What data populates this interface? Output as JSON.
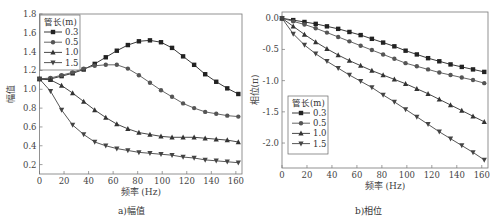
{
  "figure": {
    "captions": [
      "a)幅值",
      "b)相位"
    ]
  },
  "chart_data": [
    {
      "type": "line",
      "title": "a)幅值",
      "xlabel": "频率 (Hz)",
      "ylabel": "幅值",
      "xlim": [
        0,
        165
      ],
      "ylim": [
        0.1,
        1.8
      ],
      "xticks": [
        0,
        20,
        40,
        60,
        80,
        100,
        120,
        140,
        160
      ],
      "yticks": [
        0.2,
        0.4,
        0.6,
        0.8,
        1.0,
        1.2,
        1.4,
        1.6,
        1.8
      ],
      "ytick_labels": [
        "0.2",
        "0.4",
        "0.6",
        "0.8",
        "1.0",
        "1.2",
        "1.4",
        "1.6",
        "1.8"
      ],
      "grid": false,
      "legend": {
        "title": "管长(m)",
        "position": "upper left"
      },
      "x": [
        0,
        9,
        18,
        27,
        36,
        45,
        54,
        63,
        72,
        81,
        90,
        99,
        108,
        117,
        126,
        135,
        144,
        153,
        162
      ],
      "series": [
        {
          "name": "0.3",
          "marker": "square",
          "values": [
            1.11,
            1.11,
            1.14,
            1.17,
            1.21,
            1.27,
            1.34,
            1.41,
            1.47,
            1.51,
            1.52,
            1.5,
            1.44,
            1.35,
            1.26,
            1.16,
            1.08,
            1.01,
            0.95
          ]
        },
        {
          "name": "0.5",
          "marker": "circle",
          "values": [
            1.11,
            1.12,
            1.15,
            1.18,
            1.22,
            1.25,
            1.26,
            1.26,
            1.22,
            1.15,
            1.07,
            0.99,
            0.92,
            0.85,
            0.8,
            0.76,
            0.74,
            0.72,
            0.71
          ]
        },
        {
          "name": "1.0",
          "marker": "triangle-up",
          "values": [
            1.11,
            1.1,
            1.04,
            0.96,
            0.87,
            0.78,
            0.7,
            0.63,
            0.58,
            0.54,
            0.52,
            0.5,
            0.49,
            0.49,
            0.49,
            0.48,
            0.47,
            0.46,
            0.44
          ]
        },
        {
          "name": "1.5",
          "marker": "triangle-down",
          "values": [
            1.11,
            0.98,
            0.78,
            0.62,
            0.52,
            0.44,
            0.4,
            0.37,
            0.35,
            0.33,
            0.32,
            0.31,
            0.3,
            0.28,
            0.27,
            0.25,
            0.24,
            0.23,
            0.22
          ]
        }
      ]
    },
    {
      "type": "line",
      "title": "b)相位",
      "xlabel": "频率 (Hz)",
      "ylabel": "相位(π)",
      "xlim": [
        0,
        165
      ],
      "ylim": [
        -2.4,
        0.1
      ],
      "xticks": [
        0,
        20,
        40,
        60,
        80,
        100,
        120,
        140,
        160
      ],
      "yticks": [
        0.0,
        -0.5,
        -1.0,
        -1.5,
        -2.0
      ],
      "ytick_labels": [
        "0.0",
        "-0.5",
        "-1.0",
        "-1.5",
        "-2.0"
      ],
      "grid": false,
      "legend": {
        "title": "管长(m)",
        "position": "lower left"
      },
      "x": [
        0,
        9,
        18,
        27,
        36,
        45,
        54,
        63,
        72,
        81,
        90,
        99,
        108,
        117,
        126,
        135,
        144,
        153,
        162
      ],
      "series": [
        {
          "name": "0.3",
          "marker": "square",
          "values": [
            0.0,
            -0.03,
            -0.06,
            -0.09,
            -0.13,
            -0.17,
            -0.22,
            -0.27,
            -0.33,
            -0.39,
            -0.45,
            -0.52,
            -0.58,
            -0.64,
            -0.69,
            -0.74,
            -0.78,
            -0.82,
            -0.86
          ]
        },
        {
          "name": "0.5",
          "marker": "circle",
          "values": [
            0.0,
            -0.05,
            -0.1,
            -0.16,
            -0.23,
            -0.3,
            -0.37,
            -0.44,
            -0.51,
            -0.58,
            -0.65,
            -0.72,
            -0.77,
            -0.82,
            -0.87,
            -0.91,
            -0.95,
            -0.99,
            -1.04
          ]
        },
        {
          "name": "1.0",
          "marker": "triangle-up",
          "values": [
            0.0,
            -0.13,
            -0.26,
            -0.38,
            -0.49,
            -0.59,
            -0.68,
            -0.76,
            -0.84,
            -0.91,
            -0.98,
            -1.05,
            -1.13,
            -1.21,
            -1.3,
            -1.39,
            -1.48,
            -1.57,
            -1.66
          ]
        },
        {
          "name": "1.5",
          "marker": "triangle-down",
          "values": [
            0.0,
            -0.25,
            -0.43,
            -0.57,
            -0.69,
            -0.8,
            -0.91,
            -1.01,
            -1.11,
            -1.23,
            -1.34,
            -1.46,
            -1.58,
            -1.7,
            -1.82,
            -1.93,
            -2.04,
            -2.15,
            -2.27
          ]
        }
      ]
    }
  ]
}
